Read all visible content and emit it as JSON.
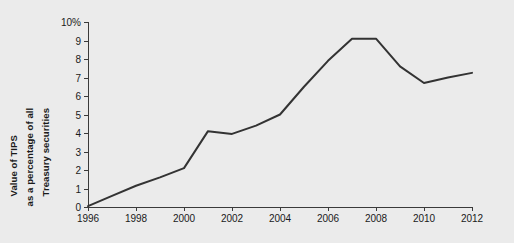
{
  "chart_data": {
    "type": "line",
    "title": "",
    "xlabel": "",
    "ylabel": "Value of TIPS as a percentage of all Treasury securities",
    "ylabel_lines": [
      "Value of TIPS",
      "as a percentage of all",
      "Treasury securities"
    ],
    "x": [
      1996,
      1997,
      1998,
      1999,
      2000,
      2001,
      2002,
      2003,
      2004,
      2005,
      2006,
      2007,
      2008,
      2009,
      2010,
      2011,
      2012
    ],
    "values": [
      0.05,
      0.6,
      1.15,
      1.6,
      2.1,
      4.1,
      3.95,
      4.4,
      5.0,
      6.5,
      7.9,
      9.1,
      9.1,
      7.6,
      6.7,
      7.0,
      7.25
    ],
    "series": [
      {
        "name": "Value of TIPS as a percentage of all Treasury securities",
        "values": [
          0.05,
          0.6,
          1.15,
          1.6,
          2.1,
          4.1,
          3.95,
          4.4,
          5.0,
          6.5,
          7.9,
          9.1,
          9.1,
          7.6,
          6.7,
          7.0,
          7.25
        ]
      }
    ],
    "xlim": [
      1996,
      2012
    ],
    "ylim": [
      0,
      10
    ],
    "x_ticks": [
      1996,
      1998,
      2000,
      2002,
      2004,
      2006,
      2008,
      2010,
      2012
    ],
    "x_tick_labels": [
      "1996",
      "1998",
      "2000",
      "2002",
      "2004",
      "2006",
      "2008",
      "2010",
      "2012"
    ],
    "y_ticks": [
      0,
      1,
      2,
      3,
      4,
      5,
      6,
      7,
      8,
      9,
      10
    ],
    "y_tick_labels": [
      "0",
      "1",
      "2",
      "3",
      "4",
      "5",
      "6",
      "7",
      "8",
      "9",
      "10%"
    ],
    "grid": false,
    "legend": false,
    "legend_position": "none",
    "line_color": "#333333",
    "background_color": "#ebebeb",
    "axis_color": "#3a3a3a"
  }
}
